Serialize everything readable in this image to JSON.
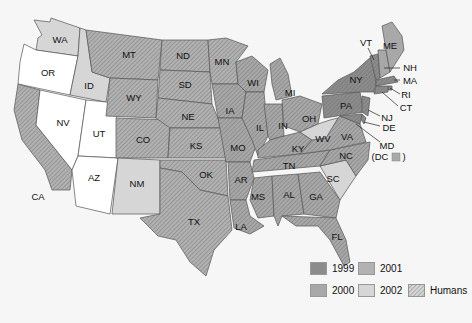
{
  "colors": {
    "y1999": "#8c8c8c",
    "y2000": "#a8a8a8",
    "y2001": "#b2b2b2",
    "y2002": "#d6d6d6",
    "none": "#ffffff",
    "background": "#f6f6f6",
    "border": "#555555"
  },
  "legend": {
    "items": [
      {
        "label": "1999",
        "key": "y1999"
      },
      {
        "label": "2000",
        "key": "y2000"
      },
      {
        "label": "2001",
        "key": "y2001"
      },
      {
        "label": "2002",
        "key": "y2002"
      },
      {
        "label": "Humans",
        "key": "hatch"
      }
    ]
  },
  "states": {
    "WA": {
      "label": "WA",
      "year": "2002",
      "humans": false
    },
    "OR": {
      "label": "OR",
      "year": null,
      "humans": false
    },
    "CA": {
      "label": "CA",
      "year": "2001",
      "humans": true
    },
    "NV": {
      "label": "NV",
      "year": null,
      "humans": false
    },
    "ID": {
      "label": "ID",
      "year": "2002",
      "humans": false
    },
    "UT": {
      "label": "UT",
      "year": null,
      "humans": false
    },
    "AZ": {
      "label": "AZ",
      "year": null,
      "humans": false
    },
    "MT": {
      "label": "MT",
      "year": "2001",
      "humans": true
    },
    "WY": {
      "label": "WY",
      "year": "2001",
      "humans": true
    },
    "CO": {
      "label": "CO",
      "year": "2001",
      "humans": true
    },
    "NM": {
      "label": "NM",
      "year": "2002",
      "humans": false
    },
    "ND": {
      "label": "ND",
      "year": "2001",
      "humans": true
    },
    "SD": {
      "label": "SD",
      "year": "2001",
      "humans": true
    },
    "NE": {
      "label": "NE",
      "year": "2001",
      "humans": true
    },
    "KS": {
      "label": "KS",
      "year": "2001",
      "humans": true
    },
    "OK": {
      "label": "OK",
      "year": "2001",
      "humans": true
    },
    "TX": {
      "label": "TX",
      "year": "2001",
      "humans": true
    },
    "MN": {
      "label": "MN",
      "year": "2001",
      "humans": true
    },
    "IA": {
      "label": "IA",
      "year": "2000",
      "humans": true
    },
    "MO": {
      "label": "MO",
      "year": "2000",
      "humans": true
    },
    "AR": {
      "label": "AR",
      "year": "2000",
      "humans": true
    },
    "LA": {
      "label": "LA",
      "year": "2000",
      "humans": true
    },
    "WI": {
      "label": "WI",
      "year": "2000",
      "humans": true
    },
    "IL": {
      "label": "IL",
      "year": "2000",
      "humans": true
    },
    "MI": {
      "label": "MI",
      "year": "2000",
      "humans": true
    },
    "IN": {
      "label": "IN",
      "year": "2000",
      "humans": true
    },
    "OH": {
      "label": "OH",
      "year": "2000",
      "humans": true
    },
    "KY": {
      "label": "KY",
      "year": "2000",
      "humans": true
    },
    "TN": {
      "label": "TN",
      "year": "2000",
      "humans": true
    },
    "MS": {
      "label": "MS",
      "year": "2000",
      "humans": true
    },
    "AL": {
      "label": "AL",
      "year": "2000",
      "humans": true
    },
    "GA": {
      "label": "GA",
      "year": "2000",
      "humans": true
    },
    "FL": {
      "label": "FL",
      "year": "2000",
      "humans": true
    },
    "SC": {
      "label": "SC",
      "year": "2002",
      "humans": false
    },
    "NC": {
      "label": "NC",
      "year": "2000",
      "humans": true
    },
    "VA": {
      "label": "VA",
      "year": "2000",
      "humans": true
    },
    "WV": {
      "label": "WV",
      "year": "2002",
      "humans": false
    },
    "PA": {
      "label": "PA",
      "year": "1999",
      "humans": true
    },
    "NY": {
      "label": "NY",
      "year": "1999",
      "humans": true
    },
    "VT": {
      "label": "VT",
      "year": "1999",
      "humans": true
    },
    "NH": {
      "label": "NH",
      "year": "2000",
      "humans": false
    },
    "ME": {
      "label": "ME",
      "year": "2000",
      "humans": false
    },
    "MA": {
      "label": "MA",
      "year": "1999",
      "humans": true
    },
    "RI": {
      "label": "RI",
      "year": "1999",
      "humans": true
    },
    "CT": {
      "label": "CT",
      "year": "1999",
      "humans": true
    },
    "NJ": {
      "label": "NJ",
      "year": "1999",
      "humans": true
    },
    "DE": {
      "label": "DE",
      "year": "1999",
      "humans": true
    },
    "MD": {
      "label": "MD",
      "year": "1999",
      "humans": true
    },
    "DC": {
      "label": "(DC",
      "suffix": ")",
      "year": "2000",
      "humans": false
    }
  }
}
